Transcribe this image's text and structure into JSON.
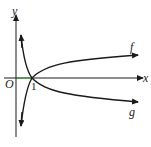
{
  "diagram": {
    "title": "",
    "axes": {
      "x_label": "x",
      "y_label": "y",
      "origin_label": "O",
      "tick_label": "1"
    },
    "curves": [
      {
        "name": "f",
        "label": "f",
        "description": "increasing logarithmic curve through (1,0)"
      },
      {
        "name": "g",
        "label": "g",
        "description": "decreasing logarithmic curve through (1,0)"
      }
    ],
    "colors": {
      "stroke": "#1a1a1a",
      "highlight_segment": "#3aa03a"
    }
  }
}
